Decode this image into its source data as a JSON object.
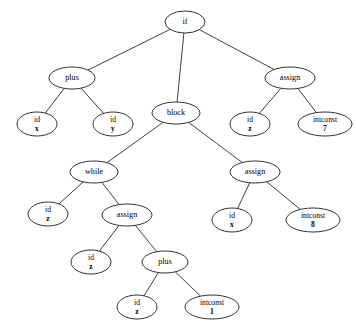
{
  "diagram": {
    "type": "tree",
    "background_color": "#ffffff",
    "node_fill_color": "#ffffff",
    "node_stroke_color": "#1c1c1c",
    "edge_color": "#2a2a2a",
    "text_color": "#000000",
    "nodes": [
      {
        "id": "n_if",
        "label": "if",
        "line1": "if",
        "line2": "",
        "x": 185,
        "y": 22,
        "rx": 20,
        "ry": 11
      },
      {
        "id": "n_plus1",
        "label": "plus",
        "line1": "plus",
        "line2": "",
        "x": 72,
        "y": 78,
        "rx": 23,
        "ry": 11
      },
      {
        "id": "n_block",
        "label": "block",
        "line1": "block",
        "line2": "",
        "x": 176,
        "y": 113,
        "rx": 24,
        "ry": 11
      },
      {
        "id": "n_assign1",
        "label": "assign",
        "line1": "assign",
        "line2": "",
        "x": 290,
        "y": 78,
        "rx": 25,
        "ry": 11
      },
      {
        "id": "n_idx1",
        "label": "id x",
        "line1": "id",
        "line2": "x",
        "x": 37,
        "y": 124,
        "rx": 20,
        "ry": 12
      },
      {
        "id": "n_idy",
        "label": "id y",
        "line1": "id",
        "line2": "y",
        "x": 113,
        "y": 124,
        "rx": 20,
        "ry": 12
      },
      {
        "id": "n_idz1",
        "label": "id z",
        "line1": "id",
        "line2": "z",
        "x": 250,
        "y": 124,
        "rx": 20,
        "ry": 12
      },
      {
        "id": "n_intconst7",
        "label": "intconst 7",
        "line1": "intconst",
        "line2": "7",
        "x": 325,
        "y": 124,
        "rx": 27,
        "ry": 12
      },
      {
        "id": "n_while",
        "label": "while",
        "line1": "while",
        "line2": "",
        "x": 94,
        "y": 172,
        "rx": 24,
        "ry": 11
      },
      {
        "id": "n_assign2",
        "label": "assign",
        "line1": "assign",
        "line2": "",
        "x": 255,
        "y": 172,
        "rx": 25,
        "ry": 11
      },
      {
        "id": "n_idz2",
        "label": "id z",
        "line1": "id",
        "line2": "z",
        "x": 48,
        "y": 214,
        "rx": 20,
        "ry": 12
      },
      {
        "id": "n_assign3",
        "label": "assign",
        "line1": "assign",
        "line2": "",
        "x": 127,
        "y": 215,
        "rx": 25,
        "ry": 11
      },
      {
        "id": "n_idx2",
        "label": "id x",
        "line1": "id",
        "line2": "x",
        "x": 232,
        "y": 220,
        "rx": 20,
        "ry": 12
      },
      {
        "id": "n_intconst8",
        "label": "intconst 8",
        "line1": "intconst",
        "line2": "8",
        "x": 313,
        "y": 220,
        "rx": 27,
        "ry": 12
      },
      {
        "id": "n_idz3",
        "label": "id z",
        "line1": "id",
        "line2": "z",
        "x": 91,
        "y": 262,
        "rx": 20,
        "ry": 12
      },
      {
        "id": "n_plus2",
        "label": "plus",
        "line1": "plus",
        "line2": "",
        "x": 165,
        "y": 262,
        "rx": 23,
        "ry": 11
      },
      {
        "id": "n_idz4",
        "label": "id z",
        "line1": "id",
        "line2": "z",
        "x": 137,
        "y": 307,
        "rx": 20,
        "ry": 12
      },
      {
        "id": "n_intconst1",
        "label": "intconst 1",
        "line1": "intconst",
        "line2": "1",
        "x": 212,
        "y": 307,
        "rx": 27,
        "ry": 12
      }
    ],
    "edges": [
      {
        "from": "n_if",
        "to": "n_plus1"
      },
      {
        "from": "n_if",
        "to": "n_block"
      },
      {
        "from": "n_if",
        "to": "n_assign1"
      },
      {
        "from": "n_plus1",
        "to": "n_idx1"
      },
      {
        "from": "n_plus1",
        "to": "n_idy"
      },
      {
        "from": "n_assign1",
        "to": "n_idz1"
      },
      {
        "from": "n_assign1",
        "to": "n_intconst7"
      },
      {
        "from": "n_block",
        "to": "n_while"
      },
      {
        "from": "n_block",
        "to": "n_assign2"
      },
      {
        "from": "n_while",
        "to": "n_idz2"
      },
      {
        "from": "n_while",
        "to": "n_assign3"
      },
      {
        "from": "n_assign2",
        "to": "n_idx2"
      },
      {
        "from": "n_assign2",
        "to": "n_intconst8"
      },
      {
        "from": "n_assign3",
        "to": "n_idz3"
      },
      {
        "from": "n_assign3",
        "to": "n_plus2"
      },
      {
        "from": "n_plus2",
        "to": "n_idz4"
      },
      {
        "from": "n_plus2",
        "to": "n_intconst1"
      }
    ]
  }
}
